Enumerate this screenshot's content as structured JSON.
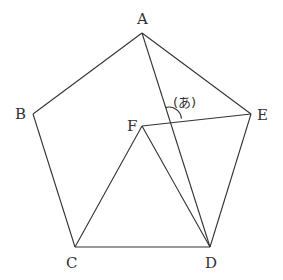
{
  "diagram": {
    "type": "geometry",
    "stroke_color": "#333333",
    "background": "#ffffff",
    "points": {
      "A": {
        "label": "A",
        "x": 142,
        "y": 33
      },
      "B": {
        "label": "B",
        "x": 33,
        "y": 114
      },
      "C": {
        "label": "C",
        "x": 75,
        "y": 247
      },
      "D": {
        "label": "D",
        "x": 210,
        "y": 247
      },
      "E": {
        "label": "E",
        "x": 251,
        "y": 114
      },
      "F": {
        "label": "F",
        "x": 142,
        "y": 126
      }
    },
    "segments": [
      [
        "A",
        "B"
      ],
      [
        "B",
        "C"
      ],
      [
        "C",
        "D"
      ],
      [
        "D",
        "E"
      ],
      [
        "E",
        "A"
      ],
      [
        "F",
        "C"
      ],
      [
        "F",
        "D"
      ],
      [
        "F",
        "E"
      ],
      [
        "A",
        "D"
      ]
    ],
    "angle_mark": {
      "label": "(あ)",
      "between": [
        [
          "A",
          "D"
        ],
        [
          "F",
          "E"
        ]
      ],
      "vertex": {
        "x": 169,
        "y": 120
      }
    }
  }
}
